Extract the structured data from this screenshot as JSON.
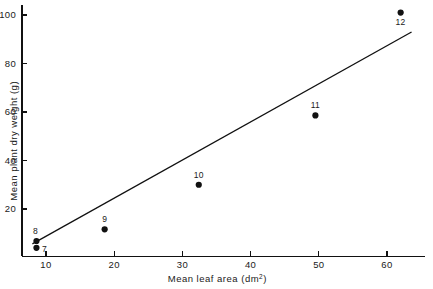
{
  "chart_data": {
    "type": "scatter",
    "title": "",
    "xlabel": "Mean leaf area (dm2)",
    "xlabel_base": "Mean leaf area (dm",
    "xlabel_sup": "2",
    "xlabel_tail": ")",
    "ylabel": "Mean plant dry weight (g)",
    "xlim": [
      6.5,
      65.5
    ],
    "ylim": [
      0.5,
      104
    ],
    "xticks": [
      10,
      20,
      30,
      40,
      50,
      60
    ],
    "xtick_labels": [
      "10",
      "20",
      "30",
      "40",
      "50",
      "60"
    ],
    "yticks": [
      20,
      40,
      60,
      80,
      100
    ],
    "ytick_labels": [
      "20",
      "40",
      "60",
      "80",
      "100"
    ],
    "grid": false,
    "legend": "none",
    "tick_direction": "in",
    "marker": "filled-circle",
    "marker_color": "#111111",
    "line_color": "#111111",
    "points": [
      {
        "label": "7",
        "x": 8.6,
        "y": 4.0,
        "label_pos": "right"
      },
      {
        "label": "8",
        "x": 8.6,
        "y": 6.8,
        "label_pos": "above-left"
      },
      {
        "label": "9",
        "x": 18.6,
        "y": 11.6,
        "label_pos": "above"
      },
      {
        "label": "10",
        "x": 32.4,
        "y": 30.0,
        "label_pos": "above"
      },
      {
        "label": "11",
        "x": 49.5,
        "y": 58.6,
        "label_pos": "above"
      },
      {
        "label": "12",
        "x": 62.0,
        "y": 101.0,
        "label_pos": "below"
      }
    ],
    "fit_line": {
      "type": "linear-regression",
      "x_start": 8.0,
      "y_start": 5.6,
      "x_end": 63.6,
      "y_end": 93.0
    }
  },
  "figure": {
    "caption": "",
    "background_color": "#ffffff",
    "foreground_color": "#111111"
  }
}
